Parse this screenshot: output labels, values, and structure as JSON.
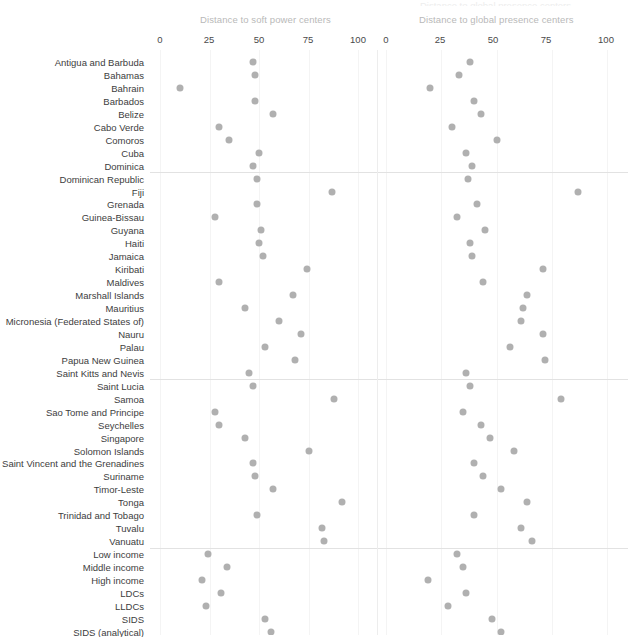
{
  "panels": [
    {
      "key": "soft_power",
      "title": "Distance to soft power centers",
      "ticks": [
        "0",
        "25",
        "50",
        "75",
        "100"
      ]
    },
    {
      "key": "global_presence",
      "title": "Distance to global presence centers",
      "ticks": [
        "0",
        "25",
        "50",
        "75",
        "100"
      ]
    }
  ],
  "axis": {
    "min": 0,
    "max": 100,
    "tick_values": [
      0,
      25,
      50,
      75,
      100
    ]
  },
  "style": {
    "dot_color": "#b0b0b0",
    "grid_color": "#f4f4f4",
    "separator_color": "#e2e2e2",
    "title_color": "#b9b9b9",
    "label_color": "#3d3d3d"
  },
  "group_breaks_after": [
    "Dominica",
    "Saint Kitts and Nevis",
    "Vanuatu"
  ],
  "chart_data": {
    "type": "scatter",
    "title": "",
    "subtitle": "",
    "xlabel": "",
    "ylabel": "",
    "xlim": [
      0,
      100
    ],
    "grid": true,
    "legend": "none",
    "layout": "two side-by-side dot-plot panels sharing one categorical y-axis",
    "categories": [
      "Antigua and Barbuda",
      "Bahamas",
      "Bahrain",
      "Barbados",
      "Belize",
      "Cabo Verde",
      "Comoros",
      "Cuba",
      "Dominica",
      "Dominican Republic",
      "Fiji",
      "Grenada",
      "Guinea-Bissau",
      "Guyana",
      "Haiti",
      "Jamaica",
      "Kiribati",
      "Maldives",
      "Marshall Islands",
      "Mauritius",
      "Micronesia (Federated States of)",
      "Nauru",
      "Palau",
      "Papua New Guinea",
      "Saint Kitts and Nevis",
      "Saint Lucia",
      "Samoa",
      "Sao Tome and Principe",
      "Seychelles",
      "Singapore",
      "Solomon Islands",
      "Saint Vincent and the Grenadines",
      "Suriname",
      "Timor-Leste",
      "Tonga",
      "Trinidad and Tobago",
      "Tuvalu",
      "Vanuatu",
      "Low income",
      "Middle income",
      "High income",
      "LDCs",
      "LLDCs",
      "SIDS",
      "SIDS (analytical)"
    ],
    "series": [
      {
        "name": "Distance to soft power centers",
        "panel": "soft_power",
        "values": [
          47,
          48,
          10,
          48,
          57,
          30,
          35,
          50,
          47,
          49,
          87,
          49,
          28,
          51,
          50,
          52,
          74,
          30,
          67,
          43,
          60,
          71,
          53,
          68,
          45,
          47,
          88,
          28,
          30,
          43,
          75,
          47,
          48,
          57,
          92,
          49,
          82,
          83,
          24,
          34,
          21,
          31,
          23,
          53,
          56
        ]
      },
      {
        "name": "Distance to global presence centers",
        "panel": "global_presence",
        "values": [
          38,
          33,
          20,
          40,
          43,
          30,
          50,
          36,
          39,
          37,
          87,
          41,
          32,
          45,
          38,
          39,
          71,
          44,
          64,
          62,
          61,
          71,
          56,
          72,
          36,
          38,
          79,
          35,
          43,
          47,
          58,
          40,
          44,
          52,
          64,
          40,
          61,
          66,
          32,
          35,
          19,
          36,
          28,
          48,
          52
        ]
      }
    ]
  }
}
